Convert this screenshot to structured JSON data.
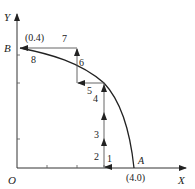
{
  "diagram": {
    "axes": {
      "x_label": "X",
      "y_label": "Y",
      "origin_label": "O"
    },
    "points": {
      "A": {
        "label": "A",
        "coord_label": "(4.0)"
      },
      "B": {
        "label": "B",
        "coord_label": "(0.4)"
      }
    },
    "step_labels": [
      "1",
      "2",
      "3",
      "4",
      "5",
      "6",
      "7",
      "8"
    ],
    "colors": {
      "line": "#222222",
      "thin_line": "#555555",
      "background": "#ffffff"
    }
  }
}
